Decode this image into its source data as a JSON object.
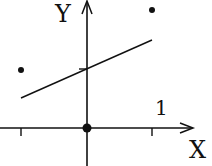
{
  "diagram": {
    "axes": {
      "x_label": "X",
      "y_label": "Y",
      "tick_label": "1"
    },
    "points": [
      {
        "name": "left-point",
        "x": -1,
        "y": 0.9
      },
      {
        "name": "right-point",
        "x": 1,
        "y": 1.9
      },
      {
        "name": "origin-point",
        "x": 0,
        "y": 0
      }
    ],
    "line": {
      "from": [
        -1,
        0.5
      ],
      "to": [
        1,
        1.3
      ]
    },
    "colors": {
      "ink": "#111111",
      "background": "#ffffff"
    }
  }
}
